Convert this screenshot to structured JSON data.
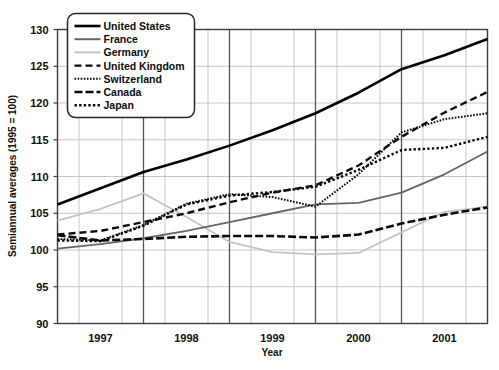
{
  "chart_data": {
    "type": "line",
    "title": "",
    "xlabel": "Year",
    "ylabel": "Semiannual averages (1995 = 100)",
    "xlim": [
      1996.5,
      2001.5
    ],
    "ylim": [
      90,
      130
    ],
    "yticks": [
      90,
      95,
      100,
      105,
      110,
      115,
      120,
      125,
      130
    ],
    "xticks": [
      1997,
      1998,
      1999,
      2000,
      2001
    ],
    "xtick_labels": [
      "1997",
      "1998",
      "1999",
      "2000",
      "2001"
    ],
    "grid": true,
    "legend_position": "top-left",
    "x": [
      1996.5,
      1997.0,
      1997.5,
      1998.0,
      1998.5,
      1999.0,
      1999.5,
      2000.0,
      2000.5,
      2001.0,
      2001.5
    ],
    "series": [
      {
        "name": "United States",
        "style": "solid",
        "color": "#000000",
        "width": 2.6,
        "values": [
          106.2,
          108.4,
          110.6,
          112.3,
          114.2,
          116.3,
          118.6,
          121.4,
          124.6,
          126.5,
          128.7
        ]
      },
      {
        "name": "France",
        "style": "solid",
        "color": "#666666",
        "width": 1.8,
        "values": [
          100.2,
          100.8,
          101.6,
          102.6,
          103.8,
          105.0,
          106.2,
          106.4,
          107.8,
          110.3,
          113.4
        ]
      },
      {
        "name": "Germany",
        "style": "solid",
        "color": "#c4c4c4",
        "width": 1.8,
        "values": [
          104.0,
          105.6,
          107.7,
          104.5,
          101.1,
          99.7,
          99.4,
          99.6,
          102.4,
          105.2,
          105.9
        ]
      },
      {
        "name": "United Kingdom",
        "style": "dashed-wide",
        "color": "#0a0a0a",
        "width": 2.4,
        "values": [
          102.1,
          102.6,
          103.8,
          105.0,
          106.5,
          107.8,
          108.8,
          111.5,
          115.4,
          118.7,
          121.5
        ]
      },
      {
        "name": "Switzerland",
        "style": "dotted-fine",
        "color": "#0a0a0a",
        "width": 2.0,
        "values": [
          101.5,
          101.3,
          103.4,
          106.3,
          107.6,
          107.2,
          105.9,
          110.3,
          116.0,
          117.8,
          118.6
        ]
      },
      {
        "name": "Canada",
        "style": "dashed-long",
        "color": "#0a0a0a",
        "width": 2.6,
        "values": [
          102.0,
          101.3,
          101.5,
          101.8,
          101.9,
          101.9,
          101.7,
          102.1,
          103.6,
          104.8,
          105.8
        ]
      },
      {
        "name": "Japan",
        "style": "dotted-round",
        "color": "#0a0a0a",
        "width": 2.4,
        "values": [
          101.3,
          101.2,
          103.3,
          106.2,
          107.4,
          107.9,
          108.6,
          110.9,
          113.6,
          113.9,
          115.4
        ]
      }
    ]
  },
  "axis": {
    "ylabel": "Semiannual averages (1995 = 100)",
    "xlabel": "Year",
    "ytick_labels": [
      "130",
      "125",
      "120",
      "115",
      "110",
      "105",
      "100",
      "95",
      "90"
    ],
    "xtick_labels": [
      "1997",
      "1998",
      "1999",
      "2000",
      "2001"
    ]
  },
  "legend": {
    "items": [
      {
        "label": "United States"
      },
      {
        "label": "France"
      },
      {
        "label": "Germany"
      },
      {
        "label": "United Kingdom"
      },
      {
        "label": "Switzerland"
      },
      {
        "label": "Canada"
      },
      {
        "label": "Japan"
      }
    ]
  }
}
